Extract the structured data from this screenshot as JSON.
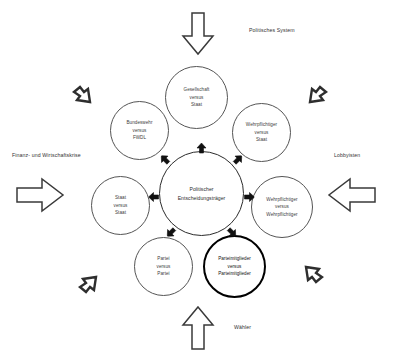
{
  "diagram": {
    "title_semantic": "conflict-spheres-diagram",
    "center": {
      "id": "politischer-entscheidungstraeger",
      "label": "Politischer\nEntscheidungsträger"
    },
    "satellites": [
      {
        "id": "gesellschaft-vs-staat",
        "label": "Gesellschaft\nversus\nStaat",
        "emphasis": false
      },
      {
        "id": "bundeswehr-vs-fwdl",
        "label": "Bundeswehr\nversus\nFWDL",
        "emphasis": false
      },
      {
        "id": "wehrpflichtiger-vs-staat",
        "label": "Wehrpflichtiger\nversus\nStaat",
        "emphasis": false
      },
      {
        "id": "staat-vs-staat",
        "label": "Staat\nversus\nStaat",
        "emphasis": false
      },
      {
        "id": "wehrpflichtiger-vs-wehrpflichtiger",
        "label": "Wehrpflichtiger\nversus\nWehrpflichtiger",
        "emphasis": false
      },
      {
        "id": "partei-vs-partei",
        "label": "Partei\nversus\nPartei",
        "emphasis": false
      },
      {
        "id": "parteimitglieder-vs-parteimitglieder",
        "label": "Parteimitglieder\nversus\nParteimitglieder",
        "emphasis": true
      }
    ],
    "outer_labels": [
      {
        "id": "politisches-system",
        "text": "Politisches System"
      },
      {
        "id": "finanz-wirtschaftskrise",
        "text": "Finanz- und Wirtschaftskrise"
      },
      {
        "id": "lobbyisten",
        "text": "Lobbyisten"
      },
      {
        "id": "waehler",
        "text": "Wähler"
      }
    ],
    "arrows": [
      {
        "id": "arrow-top-down",
        "icon": "arrow-down-icon",
        "style": "hollow-large"
      },
      {
        "id": "arrow-left-right",
        "icon": "arrow-right-icon",
        "style": "hollow-large"
      },
      {
        "id": "arrow-right-left",
        "icon": "arrow-left-icon",
        "style": "hollow-large"
      },
      {
        "id": "arrow-bottom-up",
        "icon": "arrow-up-icon",
        "style": "hollow-large"
      },
      {
        "id": "arrow-topleft-diagonal",
        "icon": "arrow-down-right-icon",
        "style": "hollow-small"
      },
      {
        "id": "arrow-topright-diagonal",
        "icon": "arrow-down-left-icon",
        "style": "hollow-small"
      },
      {
        "id": "arrow-bottomleft-diagonal",
        "icon": "arrow-up-right-icon",
        "style": "hollow-small"
      },
      {
        "id": "arrow-bottomright-diagonal",
        "icon": "arrow-up-left-icon",
        "style": "hollow-small"
      }
    ],
    "inner_arrows": [
      {
        "id": "inner-arrow-n",
        "icon": "arrow-up-icon"
      },
      {
        "id": "inner-arrow-nw",
        "icon": "arrow-up-left-icon"
      },
      {
        "id": "inner-arrow-ne",
        "icon": "arrow-up-right-icon"
      },
      {
        "id": "inner-arrow-w",
        "icon": "arrow-left-icon"
      },
      {
        "id": "inner-arrow-e",
        "icon": "arrow-right-icon"
      },
      {
        "id": "inner-arrow-sw",
        "icon": "arrow-down-left-icon"
      },
      {
        "id": "inner-arrow-se",
        "icon": "arrow-down-right-icon"
      }
    ],
    "colors": {
      "background": "#ffffff",
      "stroke": "#3a3a3a",
      "emphasis_stroke": "#000000",
      "text": "#333333",
      "inner_arrow_fill": "#111111"
    }
  }
}
